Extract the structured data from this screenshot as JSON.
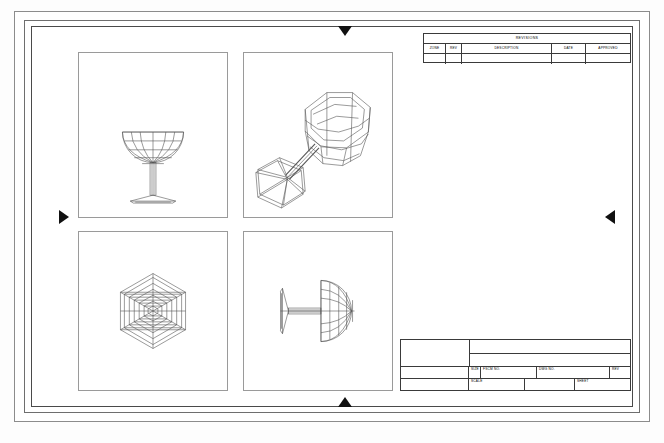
{
  "document": {
    "type": "cad-engineering-drawing",
    "subject": "wine glass / coupe wireframe",
    "sheet_layout": "four-viewport orthographic plus isometric"
  },
  "revision_block": {
    "title": "REVISIONS",
    "columns": [
      {
        "key": "zone",
        "label": "ZONE"
      },
      {
        "key": "rev",
        "label": "REV"
      },
      {
        "key": "description",
        "label": "DESCRIPTION"
      },
      {
        "key": "date",
        "label": "DATE"
      },
      {
        "key": "approved",
        "label": "APPROVED"
      }
    ],
    "rows": [
      {
        "zone": "",
        "rev": "",
        "description": "",
        "date": "",
        "approved": ""
      }
    ]
  },
  "title_block": {
    "fields": {
      "size_label": "SIZE",
      "size_value": "",
      "fscm_label": "FSCM NO.",
      "fscm_value": "",
      "dwg_label": "DWG NO.",
      "dwg_value": "",
      "rev_label": "REV",
      "rev_value": "",
      "scale_label": "SCALE",
      "scale_value": "",
      "sheet_label": "SHEET",
      "sheet_value": ""
    }
  },
  "viewports": [
    {
      "id": "top-left",
      "view": "front-elevation",
      "name": "wine-glass-front-view"
    },
    {
      "id": "top-right",
      "view": "isometric",
      "name": "wine-glass-isometric-view"
    },
    {
      "id": "bottom-left",
      "view": "top-plan",
      "name": "wine-glass-top-view"
    },
    {
      "id": "bottom-right",
      "view": "side-rotated",
      "name": "wine-glass-side-view"
    }
  ],
  "center_marks": [
    {
      "position": "top",
      "direction": "down"
    },
    {
      "position": "bottom",
      "direction": "up"
    },
    {
      "position": "left",
      "direction": "right"
    },
    {
      "position": "right",
      "direction": "left"
    }
  ],
  "colors": {
    "paper": "#ffffff",
    "line": "#3a3a3a",
    "geometry": "#555555",
    "frame": "#8c8c8c"
  },
  "caption": ""
}
